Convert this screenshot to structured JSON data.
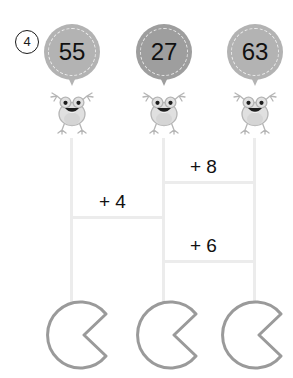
{
  "exercise": {
    "number": "4"
  },
  "colors": {
    "balloon_light": "#b3b3b3",
    "balloon_dark": "#9e9e9e",
    "rail": "#ececec",
    "text": "#111111",
    "pad_outline": "#9a9a9a",
    "frog_body": "#e0e0e0",
    "frog_outline": "#b5b5b5"
  },
  "balloons": [
    {
      "value": "55",
      "shade": "#b3b3b3",
      "x": 44,
      "y": 24
    },
    {
      "value": "27",
      "shade": "#9e9e9e",
      "x": 136,
      "y": 24
    },
    {
      "value": "63",
      "shade": "#b3b3b3",
      "x": 227,
      "y": 24
    }
  ],
  "frogs": [
    {
      "name": "frog-left",
      "x": 47,
      "y": 89
    },
    {
      "name": "frog-middle",
      "x": 139,
      "y": 89
    },
    {
      "name": "frog-right",
      "x": 230,
      "y": 89
    }
  ],
  "rails": [
    {
      "name": "rail-left",
      "x": 70,
      "y": 138,
      "height": 166
    },
    {
      "name": "rail-middle",
      "x": 162,
      "y": 138,
      "height": 166
    },
    {
      "name": "rail-right",
      "x": 253,
      "y": 138,
      "height": 166
    }
  ],
  "rungs": [
    {
      "name": "rung-plus4-bottom",
      "x": 70,
      "y": 216,
      "width": 95
    },
    {
      "name": "rung-plus8-bottom",
      "x": 162,
      "y": 181,
      "width": 94
    },
    {
      "name": "rung-plus6-bottom",
      "x": 162,
      "y": 260,
      "width": 94
    }
  ],
  "operations": [
    {
      "label": "+ 4",
      "name": "operation-plus-4",
      "x": 99,
      "y": 191
    },
    {
      "label": "+ 8",
      "name": "operation-plus-8",
      "x": 190,
      "y": 156
    },
    {
      "label": "+ 6",
      "name": "operation-plus-6",
      "x": 190,
      "y": 235
    }
  ],
  "answer_pads": [
    {
      "name": "answer-pad-left",
      "value": "",
      "x": 40,
      "y": 300
    },
    {
      "name": "answer-pad-middle",
      "value": "",
      "x": 130,
      "y": 300
    },
    {
      "name": "answer-pad-right",
      "value": "",
      "x": 215,
      "y": 300
    }
  ]
}
